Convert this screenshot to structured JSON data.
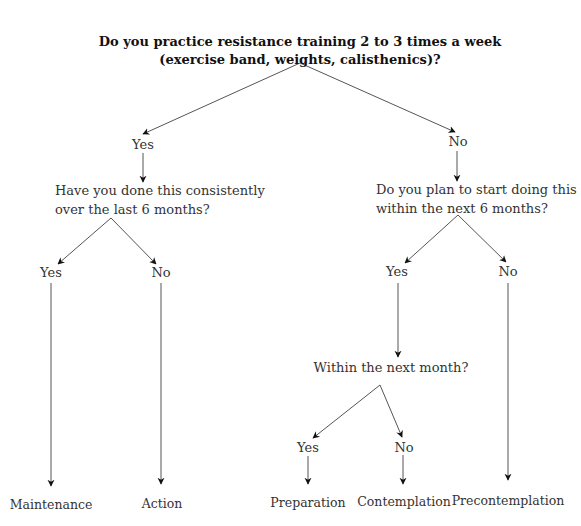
{
  "diagram": {
    "root_question": {
      "line1": "Do you practice resistance training 2 to 3 times a week",
      "line2": "(exercise band, weights, calisthenics)?"
    },
    "branches": {
      "yes": {
        "label": "Yes",
        "question": {
          "line1": "Have you done this consistently",
          "line2": "over the last 6 months?"
        },
        "yes": {
          "label": "Yes",
          "outcome": "Maintenance"
        },
        "no": {
          "label": "No",
          "outcome": "Action"
        }
      },
      "no": {
        "label": "No",
        "question": {
          "line1": "Do you plan to start doing this",
          "line2": "within the next 6 months?"
        },
        "yes": {
          "label": "Yes",
          "question": "Within the next month?",
          "yes": {
            "label": "Yes",
            "outcome": "Preparation"
          },
          "no": {
            "label": "No",
            "outcome": "Contemplation"
          }
        },
        "no": {
          "label": "No",
          "outcome": "Precontemplation"
        }
      }
    },
    "colors": {
      "line": "#555555",
      "text": "#222222",
      "background": "#ffffff"
    }
  }
}
